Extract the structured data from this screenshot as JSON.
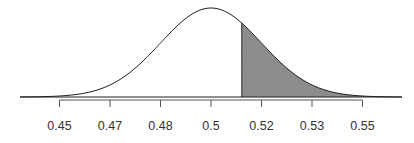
{
  "chart_data": {
    "type": "area",
    "title": "",
    "xlabel": "",
    "ylabel": "",
    "distribution": {
      "mean": 0.5,
      "sd": 0.0158
    },
    "tick_labels": [
      "0.45",
      "0.47",
      "0.48",
      "0.5",
      "0.52",
      "0.53",
      "0.55"
    ],
    "tick_positions_sd": [
      -3,
      -2,
      -1,
      0,
      1,
      2,
      3
    ],
    "shaded_region": {
      "from": 0.51,
      "to": "upper tail",
      "z_from": 0.61
    },
    "xlim": [
      0.43,
      0.57
    ],
    "grid": false,
    "legend": "none",
    "colors": {
      "curve": "#222222",
      "fill": "#8c8c8c",
      "axis": "#555555"
    }
  }
}
